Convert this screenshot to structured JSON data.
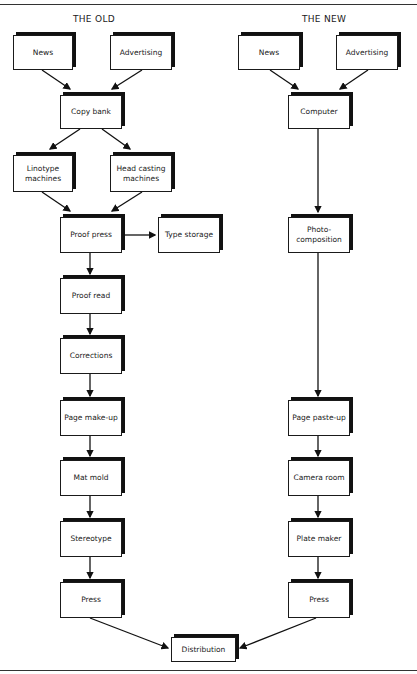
{
  "headings": {
    "old": "THE OLD",
    "new": "THE NEW"
  },
  "old": {
    "news": "News",
    "advertising": "Advertising",
    "copy_bank": "Copy bank",
    "linotype": "Linotype machines",
    "head_casting": "Head casting machines",
    "proof_press": "Proof press",
    "type_storage": "Type storage",
    "proof_read": "Proof read",
    "corrections": "Corrections",
    "page_makeup": "Page make-up",
    "mat_mold": "Mat mold",
    "stereotype": "Stereotype",
    "press": "Press"
  },
  "new": {
    "news": "News",
    "advertising": "Advertising",
    "computer": "Computer",
    "photo_composition": "Photo-composition",
    "page_pasteup": "Page paste-up",
    "camera_room": "Camera room",
    "plate_maker": "Plate maker",
    "press": "Press"
  },
  "shared": {
    "distribution": "Distribution"
  }
}
